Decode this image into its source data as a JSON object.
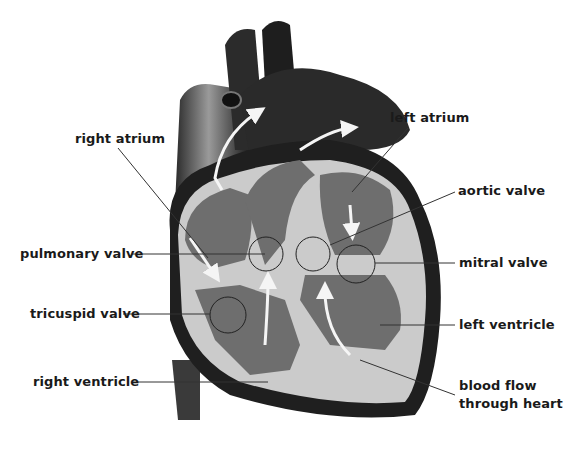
{
  "diagram": {
    "colors": {
      "dark": "#1c1c1c",
      "chamber": "#6e6e6e",
      "wall": "#c8c8c8",
      "arrow": "#f5f5f5",
      "line": "#333333"
    },
    "labels": {
      "right_atrium": "right atrium",
      "left_atrium": "left atrium",
      "aortic_valve": "aortic valve",
      "pulmonary_valve": "pulmonary valve",
      "mitral_valve": "mitral valve",
      "tricuspid_valve": "tricuspid valve",
      "left_ventricle": "left ventricle",
      "right_ventricle": "right ventricle",
      "blood_flow_line1": "blood flow",
      "blood_flow_line2": "through heart"
    }
  }
}
